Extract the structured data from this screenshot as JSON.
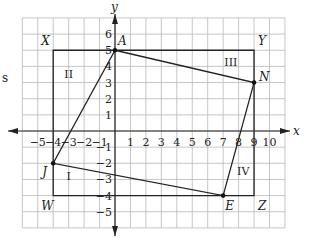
{
  "side_text": "s",
  "axes": {
    "x_label": "x",
    "y_label": "y",
    "x_ticks": [
      "−5",
      "−4",
      "−3",
      "−2",
      "−1",
      "1",
      "2",
      "3",
      "4",
      "5",
      "6",
      "7",
      "8",
      "9",
      "10"
    ],
    "x_tick_values": [
      -5,
      -4,
      -3,
      -2,
      -1,
      1,
      2,
      3,
      4,
      5,
      6,
      7,
      8,
      9,
      10
    ],
    "y_ticks": [
      "6",
      "5",
      "4",
      "3",
      "2",
      "1",
      "−1",
      "−2",
      "−3",
      "−4",
      "−5"
    ],
    "y_tick_values": [
      6,
      5,
      4,
      3,
      2,
      1,
      -1,
      -2,
      -3,
      -4,
      -5
    ],
    "x_range": [
      -6,
      11
    ],
    "y_range": [
      -6,
      7
    ]
  },
  "rectangle": {
    "corners": [
      {
        "label": "X",
        "x": -4,
        "y": 5
      },
      {
        "label": "Y",
        "x": 9,
        "y": 5
      },
      {
        "label": "Z",
        "x": 9,
        "y": -4
      },
      {
        "label": "W",
        "x": -4,
        "y": -4
      }
    ]
  },
  "quadrilateral": {
    "vertices": [
      {
        "label": "A",
        "x": 0,
        "y": 5
      },
      {
        "label": "N",
        "x": 9,
        "y": 3
      },
      {
        "label": "E",
        "x": 7,
        "y": -4
      },
      {
        "label": "J",
        "x": -4,
        "y": -2
      }
    ]
  },
  "regions": [
    {
      "label": "I",
      "x": -3,
      "y": -2.8
    },
    {
      "label": "II",
      "x": -3,
      "y": 3.5
    },
    {
      "label": "III",
      "x": 7.5,
      "y": 4.3
    },
    {
      "label": "IV",
      "x": 8.3,
      "y": -2.5
    }
  ]
}
